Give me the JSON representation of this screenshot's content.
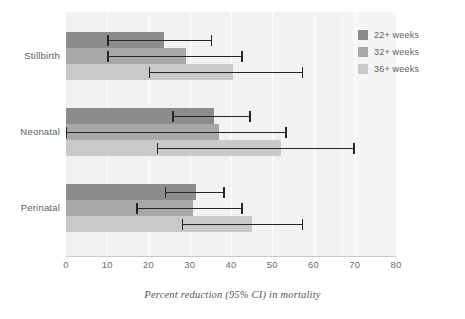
{
  "chart": {
    "type": "bar",
    "orientation": "horizontal",
    "xlabel": "Percent reduction (95% CI) in mortality",
    "ylabel": "",
    "title": "",
    "xlim": [
      0,
      80
    ],
    "xticks": [
      0,
      10,
      20,
      30,
      40,
      50,
      60,
      70,
      80
    ],
    "xtick_labels": [
      "0",
      "10",
      "20",
      "30",
      "40",
      "50",
      "60",
      "70",
      "80"
    ],
    "grid": true,
    "legend_position": "top-right",
    "panel_background": "#f2f2f2"
  },
  "legend": {
    "items": [
      {
        "label": "22+ weeks",
        "color": "#8c8c8c"
      },
      {
        "label": "32+ weeks",
        "color": "#a8a8a8"
      },
      {
        "label": "36+ weeks",
        "color": "#c9c9c9"
      }
    ]
  },
  "chart_data": {
    "type": "bar",
    "orientation": "horizontal",
    "title": "",
    "xlabel": "Percent reduction (95% CI) in mortality",
    "ylabel": "",
    "xlim": [
      0,
      80
    ],
    "xticks": [
      0,
      10,
      20,
      30,
      40,
      50,
      60,
      70,
      80
    ],
    "grid": true,
    "legend_position": "top-right",
    "categories": [
      "Stillbirth",
      "Neonatal",
      "Perinatal"
    ],
    "series": [
      {
        "name": "22+ weeks",
        "color": "#8c8c8c",
        "values": [
          23.7,
          35.8,
          31.5
        ],
        "ci_low": [
          10.0,
          25.8,
          24.0
        ],
        "ci_high": [
          35.5,
          44.8,
          38.5
        ]
      },
      {
        "name": "32+ weeks",
        "color": "#a8a8a8",
        "values": [
          29.0,
          37.0,
          30.8
        ],
        "ci_low": [
          10.0,
          0.0,
          17.0
        ],
        "ci_high": [
          42.8,
          53.5,
          42.8
        ]
      },
      {
        "name": "36+ weeks",
        "color": "#c9c9c9",
        "values": [
          40.5,
          52.0,
          45.2
        ],
        "ci_low": [
          20.0,
          22.0,
          28.0
        ],
        "ci_high": [
          57.5,
          70.0,
          57.5
        ]
      }
    ]
  }
}
